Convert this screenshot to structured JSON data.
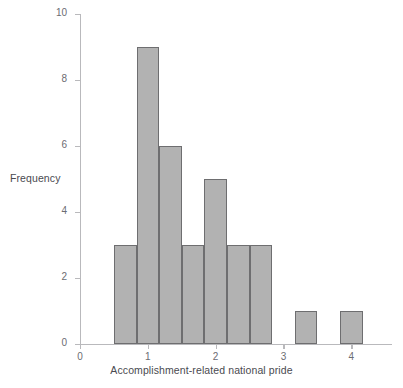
{
  "chart_data": {
    "type": "bar",
    "title": "",
    "subtitle": "",
    "xlabel": "Accomplishment-related national pride",
    "ylabel": "Frequency",
    "xlim": [
      0,
      4.6
    ],
    "ylim": [
      0,
      10
    ],
    "xticks": [
      0,
      1,
      2,
      3,
      4
    ],
    "xtick_labels": [
      "0",
      "1",
      "2",
      "3",
      "4"
    ],
    "yticks": [
      0,
      2,
      4,
      6,
      8,
      10
    ],
    "ytick_labels": [
      "0",
      "2",
      "4",
      "6",
      "8",
      "10"
    ],
    "grid": false,
    "legend": null,
    "bin_width": 0.3333,
    "bars": [
      {
        "label": "0.50-0.83",
        "bin_start": 0.5,
        "bin_end": 0.8333,
        "value": 3
      },
      {
        "label": "0.83-1.17",
        "bin_start": 0.8333,
        "bin_end": 1.1667,
        "value": 9
      },
      {
        "label": "1.17-1.50",
        "bin_start": 1.1667,
        "bin_end": 1.5,
        "value": 6
      },
      {
        "label": "1.50-1.83",
        "bin_start": 1.5,
        "bin_end": 1.8333,
        "value": 3
      },
      {
        "label": "1.83-2.17",
        "bin_start": 1.8333,
        "bin_end": 2.1667,
        "value": 5
      },
      {
        "label": "2.17-2.50",
        "bin_start": 2.1667,
        "bin_end": 2.5,
        "value": 3
      },
      {
        "label": "2.50-2.83",
        "bin_start": 2.5,
        "bin_end": 2.8333,
        "value": 3
      },
      {
        "label": "3.17-3.50",
        "bin_start": 3.1667,
        "bin_end": 3.5,
        "value": 1
      },
      {
        "label": "3.83-4.17",
        "bin_start": 3.8333,
        "bin_end": 4.1667,
        "value": 1
      }
    ],
    "colors": {
      "bar_fill": "#b2b2b2",
      "bar_edge": "#6e6e70",
      "axis": "#b9b9bc",
      "text": "#4a4a50",
      "tick_text": "#6c6c72",
      "background": "#ffffff"
    }
  }
}
